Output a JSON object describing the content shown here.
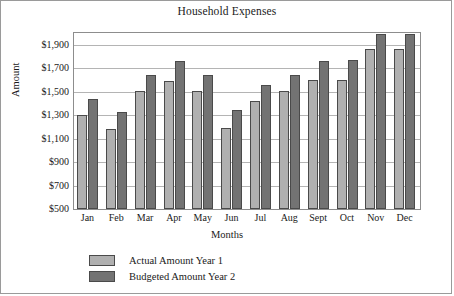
{
  "chart_data": {
    "type": "bar",
    "title": "Household Expenses",
    "xlabel": "Months",
    "ylabel": "Amount",
    "categories": [
      "Jan",
      "Feb",
      "Mar",
      "Apr",
      "May",
      "Jun",
      "Jul",
      "Aug",
      "Sept",
      "Oct",
      "Nov",
      "Dec"
    ],
    "series": [
      {
        "name": "Actual Amount Year 1",
        "color": "#b0b0b0",
        "values": [
          1300,
          1180,
          1505,
          1590,
          1505,
          1190,
          1420,
          1510,
          1600,
          1600,
          1860,
          1860
        ]
      },
      {
        "name": "Budgeted Amount Year 2",
        "color": "#737373",
        "values": [
          1440,
          1330,
          1640,
          1760,
          1640,
          1340,
          1560,
          1640,
          1760,
          1770,
          1990,
          1990
        ]
      }
    ],
    "ylim": [
      500,
      2000
    ],
    "y_ticks": [
      500,
      700,
      900,
      1100,
      1300,
      1500,
      1700,
      1900
    ],
    "y_tick_labels": [
      "$500",
      "$700",
      "$900",
      "$1,100",
      "$1,300",
      "$1,500",
      "$1,700",
      "$1,900"
    ],
    "grid": true,
    "legend_position": "bottom-left"
  }
}
